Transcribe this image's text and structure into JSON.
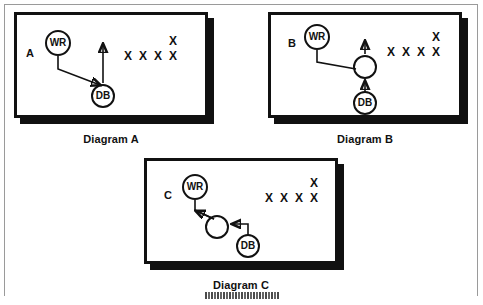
{
  "page": {
    "background": "#ffffff",
    "ink": "#111111",
    "border_color": "#9a9a9a"
  },
  "diagrams": [
    {
      "id": "a",
      "caption": "Diagram A",
      "key_label": "A",
      "nodes": [
        {
          "id": "wr",
          "label": "WR",
          "kind": "receiver"
        },
        {
          "id": "db",
          "label": "DB",
          "kind": "defender-back"
        }
      ],
      "defenders": {
        "row_glyph": "X",
        "row_count": 4,
        "offset_glyph": "X",
        "offset_count": 1
      },
      "routes": [
        {
          "from": "wr",
          "to": "db",
          "style": "stem-then-diagonal",
          "arrow": "at-db"
        },
        {
          "from": "db",
          "to": "upfield",
          "style": "straight-vertical",
          "arrow": "at-top"
        }
      ]
    },
    {
      "id": "b",
      "caption": "Diagram B",
      "key_label": "B",
      "nodes": [
        {
          "id": "wr",
          "label": "WR",
          "kind": "receiver"
        },
        {
          "id": "hub",
          "label": "",
          "kind": "open-spot"
        },
        {
          "id": "db",
          "label": "DB",
          "kind": "defender-back"
        }
      ],
      "defenders": {
        "row_glyph": "X",
        "row_count": 4,
        "offset_glyph": "X",
        "offset_count": 1
      },
      "routes": [
        {
          "from": "wr",
          "to": "hub",
          "style": "stem-then-diagonal",
          "arrow": "none"
        },
        {
          "from": "db",
          "to": "hub",
          "style": "straight-vertical",
          "arrow": "at-hub"
        },
        {
          "from": "hub",
          "to": "upfield",
          "style": "straight-vertical",
          "arrow": "at-top"
        }
      ]
    },
    {
      "id": "c",
      "caption": "Diagram C",
      "key_label": "C",
      "nodes": [
        {
          "id": "wr",
          "label": "WR",
          "kind": "receiver"
        },
        {
          "id": "hub",
          "label": "",
          "kind": "open-spot"
        },
        {
          "id": "db",
          "label": "DB",
          "kind": "defender-back"
        }
      ],
      "defenders": {
        "row_glyph": "X",
        "row_count": 4,
        "offset_glyph": "X",
        "offset_count": 1
      },
      "routes": [
        {
          "from": "hub",
          "to": "wr",
          "style": "stem-then-diagonal",
          "arrow": "at-wr"
        },
        {
          "from": "db",
          "to": "hub",
          "style": "elbow",
          "arrow": "at-hub"
        }
      ]
    }
  ]
}
